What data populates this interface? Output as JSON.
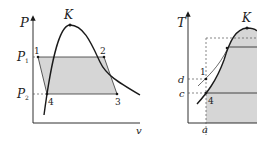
{
  "left_diagram": {
    "y_axis_label": "P",
    "x_axis_label": "v",
    "critical_point_label": "K",
    "pressure_high_label": "P",
    "pressure_high_sub": "1",
    "pressure_low_label": "P",
    "pressure_low_sub": "2",
    "points": [
      "1",
      "2",
      "3",
      "4"
    ]
  },
  "right_diagram": {
    "y_axis_label": "T",
    "x_axis_label": "a",
    "critical_point_label": "K",
    "temp_d_label": "d",
    "temp_c_label": "c",
    "points": [
      "1",
      "4"
    ]
  },
  "colors": {
    "line": "#1a1a1a",
    "fill": "#d6d6d6",
    "dashed": "#555555"
  }
}
